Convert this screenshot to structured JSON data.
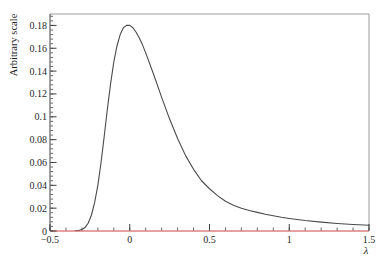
{
  "chart_data": {
    "type": "line",
    "xlabel": "λ",
    "ylabel": "Arbitrary scale",
    "xlim": [
      -0.5,
      1.5
    ],
    "ylim": [
      0,
      0.19
    ],
    "grid": false,
    "legend": null,
    "x_major_ticks": [
      -0.5,
      0,
      0.5,
      1,
      1.5
    ],
    "x_major_tick_labels": [
      "−0.5",
      "0",
      "0.5",
      "1",
      "1.5"
    ],
    "x_minor_step": 0.1,
    "y_major_ticks": [
      0,
      0.02,
      0.04,
      0.06,
      0.08,
      0.1,
      0.12,
      0.14,
      0.16,
      0.18
    ],
    "y_major_tick_labels": [
      "0",
      "0.02",
      "0.04",
      "0.06",
      "0.08",
      "0.1",
      "0.12",
      "0.14",
      "0.16",
      "0.18"
    ],
    "y_minor_step": 0.004,
    "zero_line": {
      "y": 0,
      "color": "#cc4444"
    },
    "colors": {
      "curve": "#4a4a4a",
      "zero_line": "#cc4444",
      "axis": "#3f3f3f",
      "frame_light": "#9c9c9c",
      "text": "#1f1f1f",
      "background": "#ffffff"
    },
    "series": [
      {
        "name": "landau-distribution",
        "color": "#4a4a4a",
        "points": [
          [
            -0.34,
            0.0002
          ],
          [
            -0.32,
            0.0005
          ],
          [
            -0.3,
            0.0013
          ],
          [
            -0.28,
            0.003
          ],
          [
            -0.26,
            0.007
          ],
          [
            -0.24,
            0.014
          ],
          [
            -0.22,
            0.025
          ],
          [
            -0.2,
            0.04
          ],
          [
            -0.18,
            0.06
          ],
          [
            -0.16,
            0.083
          ],
          [
            -0.14,
            0.107
          ],
          [
            -0.12,
            0.129
          ],
          [
            -0.1,
            0.148
          ],
          [
            -0.08,
            0.162
          ],
          [
            -0.06,
            0.172
          ],
          [
            -0.04,
            0.178
          ],
          [
            -0.02,
            0.18
          ],
          [
            0.0,
            0.18
          ],
          [
            0.02,
            0.178
          ],
          [
            0.04,
            0.174
          ],
          [
            0.06,
            0.169
          ],
          [
            0.08,
            0.163
          ],
          [
            0.1,
            0.156
          ],
          [
            0.15,
            0.137
          ],
          [
            0.2,
            0.117
          ],
          [
            0.25,
            0.098
          ],
          [
            0.3,
            0.081
          ],
          [
            0.35,
            0.066
          ],
          [
            0.4,
            0.054
          ],
          [
            0.45,
            0.044
          ],
          [
            0.5,
            0.037
          ],
          [
            0.55,
            0.031
          ],
          [
            0.6,
            0.026
          ],
          [
            0.65,
            0.0225
          ],
          [
            0.7,
            0.02
          ],
          [
            0.75,
            0.018
          ],
          [
            0.8,
            0.0163
          ],
          [
            0.85,
            0.0147
          ],
          [
            0.9,
            0.0133
          ],
          [
            0.95,
            0.012
          ],
          [
            1.0,
            0.011
          ],
          [
            1.1,
            0.0092
          ],
          [
            1.2,
            0.0078
          ],
          [
            1.3,
            0.0066
          ],
          [
            1.4,
            0.0057
          ],
          [
            1.5,
            0.005
          ]
        ]
      }
    ]
  }
}
